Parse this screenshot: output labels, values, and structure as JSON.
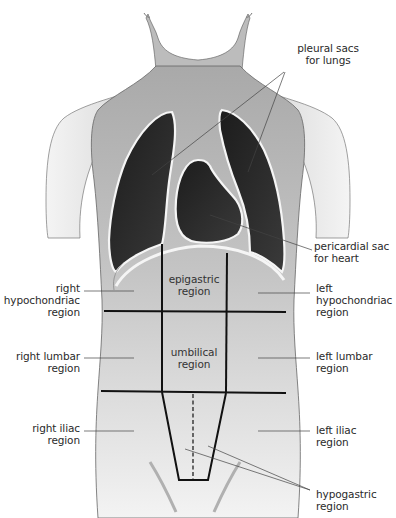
{
  "figure": {
    "colors": {
      "skin": "#bdbdbd",
      "skin_light": "#e6e6e6",
      "cavity": "#2b2b2b",
      "membrane": "#f4f4f4",
      "grid_line": "#111111",
      "leader_line": "#444444",
      "text": "#2a2a2a"
    }
  },
  "labels": {
    "pleural_sacs": "pleural sacs\nfor lungs",
    "pericardial_sac": "pericardial sac\nfor heart",
    "right_hypochondriac": "right\nhypochondriac\nregion",
    "left_hypochondriac": "left\nhypochondriac\nregion",
    "epigastric": "epigastric\nregion",
    "right_lumbar": "right lumbar\nregion",
    "umbilical": "umbilical\nregion",
    "left_lumbar": "left lumbar\nregion",
    "right_iliac": "right iliac\nregion",
    "left_iliac": "left iliac\nregion",
    "hypogastric": "hypogastric\nregion"
  }
}
